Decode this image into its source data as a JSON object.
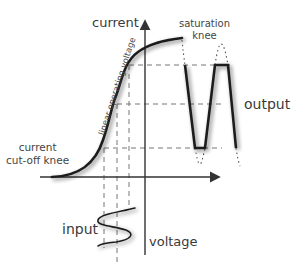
{
  "diagram": {
    "type": "transistor transfer characteristic",
    "labels": {
      "y_axis": "current",
      "x_axis": "voltage",
      "saturation_line1": "saturation",
      "saturation_line2": "knee",
      "output": "output",
      "cutoff_line1": "current",
      "cutoff_line2": "cut-off knee",
      "input": "input",
      "linear_region": "linear operating voltage"
    },
    "colors": {
      "line": "#222222",
      "dashed": "#666666",
      "shadow": "#9a9a9a",
      "text": "#3a3a3a",
      "background": "#ffffff"
    }
  }
}
